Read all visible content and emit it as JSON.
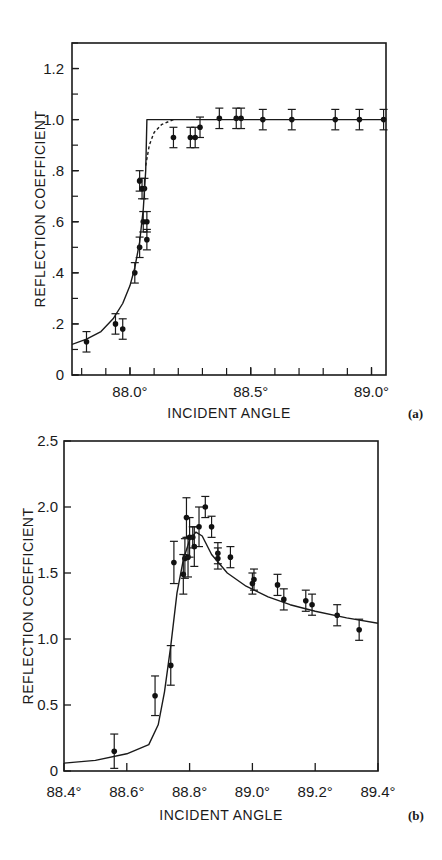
{
  "chart_data": [
    {
      "id": "a",
      "panel_label": "(a)",
      "type": "scatter",
      "title": "",
      "xlabel": "INCIDENT ANGLE",
      "ylabel": "REFLECTION COEFFICIENT",
      "xlim": [
        87.76,
        89.06
      ],
      "ylim": [
        0,
        1.3
      ],
      "x_ticks": [
        {
          "v": 88.0,
          "label": "88.0°"
        },
        {
          "v": 88.5,
          "label": "88.5°"
        },
        {
          "v": 89.0,
          "label": "89.0°"
        }
      ],
      "x_minor_step": 0.1,
      "y_ticks": [
        {
          "v": 0,
          "label": "0"
        },
        {
          "v": 0.2,
          "label": ".2"
        },
        {
          "v": 0.4,
          "label": ".4"
        },
        {
          "v": 0.6,
          "label": ".6"
        },
        {
          "v": 0.8,
          "label": ".8"
        },
        {
          "v": 1.0,
          "label": "1.0"
        },
        {
          "v": 1.2,
          "label": "1.2"
        }
      ],
      "y_minor_step": 0.1,
      "grid": false,
      "series": [
        {
          "name": "measured",
          "style": "points-with-error-bars",
          "points": [
            {
              "x": 87.82,
              "y": 0.13,
              "err": 0.04
            },
            {
              "x": 87.94,
              "y": 0.2,
              "err": 0.04
            },
            {
              "x": 87.97,
              "y": 0.18,
              "err": 0.04
            },
            {
              "x": 88.02,
              "y": 0.4,
              "err": 0.04
            },
            {
              "x": 88.04,
              "y": 0.5,
              "err": 0.04
            },
            {
              "x": 88.04,
              "y": 0.76,
              "err": 0.04
            },
            {
              "x": 88.05,
              "y": 0.73,
              "err": 0.04
            },
            {
              "x": 88.055,
              "y": 0.6,
              "err": 0.04
            },
            {
              "x": 88.06,
              "y": 0.73,
              "err": 0.04
            },
            {
              "x": 88.07,
              "y": 0.6,
              "err": 0.04
            },
            {
              "x": 88.07,
              "y": 0.53,
              "err": 0.04
            },
            {
              "x": 88.18,
              "y": 0.93,
              "err": 0.04
            },
            {
              "x": 88.25,
              "y": 0.93,
              "err": 0.04
            },
            {
              "x": 88.27,
              "y": 0.93,
              "err": 0.04
            },
            {
              "x": 88.29,
              "y": 0.97,
              "err": 0.04
            },
            {
              "x": 88.37,
              "y": 1.005,
              "err": 0.04
            },
            {
              "x": 88.44,
              "y": 1.005,
              "err": 0.04
            },
            {
              "x": 88.46,
              "y": 1.005,
              "err": 0.04
            },
            {
              "x": 88.55,
              "y": 1.0,
              "err": 0.04
            },
            {
              "x": 88.67,
              "y": 1.0,
              "err": 0.04
            },
            {
              "x": 88.85,
              "y": 1.0,
              "err": 0.04
            },
            {
              "x": 88.95,
              "y": 1.0,
              "err": 0.04
            },
            {
              "x": 89.05,
              "y": 1.0,
              "err": 0.04
            }
          ]
        },
        {
          "name": "theory-solid",
          "style": "solid-line",
          "points": [
            [
              87.76,
              0.12
            ],
            [
              87.82,
              0.14
            ],
            [
              87.88,
              0.17
            ],
            [
              87.93,
              0.22
            ],
            [
              87.97,
              0.28
            ],
            [
              88.0,
              0.35
            ],
            [
              88.02,
              0.42
            ],
            [
              88.04,
              0.52
            ],
            [
              88.055,
              0.65
            ],
            [
              88.065,
              0.8
            ],
            [
              88.07,
              1.0
            ],
            [
              89.06,
              1.0
            ]
          ]
        },
        {
          "name": "theory-dashed",
          "style": "dashed-line",
          "points": [
            [
              88.065,
              0.82
            ],
            [
              88.08,
              0.9
            ],
            [
              88.1,
              0.95
            ],
            [
              88.13,
              0.98
            ],
            [
              88.18,
              1.0
            ]
          ]
        }
      ]
    },
    {
      "id": "b",
      "panel_label": "(b)",
      "type": "scatter",
      "title": "",
      "xlabel": "INCIDENT ANGLE",
      "ylabel": "REFLECTION COEFFICIENT",
      "xlim": [
        88.4,
        89.4
      ],
      "ylim": [
        0,
        2.5
      ],
      "x_ticks": [
        {
          "v": 88.4,
          "label": "88.4°"
        },
        {
          "v": 88.6,
          "label": "88.6°"
        },
        {
          "v": 88.8,
          "label": "88.8°"
        },
        {
          "v": 89.0,
          "label": "89.0°"
        },
        {
          "v": 89.2,
          "label": "89.2°"
        },
        {
          "v": 89.4,
          "label": "89.4°"
        }
      ],
      "y_ticks": [
        {
          "v": 0,
          "label": "0"
        },
        {
          "v": 0.5,
          "label": "0.5"
        },
        {
          "v": 1.0,
          "label": "1.0"
        },
        {
          "v": 1.5,
          "label": "1.5"
        },
        {
          "v": 2.0,
          "label": "2.0"
        },
        {
          "v": 2.5,
          "label": "2.5"
        }
      ],
      "grid": false,
      "series": [
        {
          "name": "measured",
          "style": "points-with-error-bars",
          "points": [
            {
              "x": 88.56,
              "y": 0.15,
              "err": 0.13
            },
            {
              "x": 88.69,
              "y": 0.57,
              "err": 0.15
            },
            {
              "x": 88.74,
              "y": 0.8,
              "err": 0.15
            },
            {
              "x": 88.75,
              "y": 1.58,
              "err": 0.16
            },
            {
              "x": 88.78,
              "y": 1.49,
              "err": 0.15
            },
            {
              "x": 88.785,
              "y": 1.61,
              "err": 0.15
            },
            {
              "x": 88.79,
              "y": 1.92,
              "err": 0.15
            },
            {
              "x": 88.795,
              "y": 1.62,
              "err": 0.15
            },
            {
              "x": 88.8,
              "y": 1.77,
              "err": 0.15
            },
            {
              "x": 88.81,
              "y": 1.77,
              "err": 0.08
            },
            {
              "x": 88.815,
              "y": 1.7,
              "err": 0.15
            },
            {
              "x": 88.83,
              "y": 1.85,
              "err": 0.15
            },
            {
              "x": 88.85,
              "y": 2.0,
              "err": 0.08
            },
            {
              "x": 88.87,
              "y": 1.85,
              "err": 0.08
            },
            {
              "x": 88.89,
              "y": 1.65,
              "err": 0.08
            },
            {
              "x": 88.89,
              "y": 1.61,
              "err": 0.08
            },
            {
              "x": 88.93,
              "y": 1.62,
              "err": 0.08
            },
            {
              "x": 89.0,
              "y": 1.42,
              "err": 0.08
            },
            {
              "x": 89.005,
              "y": 1.45,
              "err": 0.08
            },
            {
              "x": 89.08,
              "y": 1.41,
              "err": 0.08
            },
            {
              "x": 89.1,
              "y": 1.3,
              "err": 0.08
            },
            {
              "x": 89.17,
              "y": 1.29,
              "err": 0.08
            },
            {
              "x": 89.19,
              "y": 1.26,
              "err": 0.08
            },
            {
              "x": 89.27,
              "y": 1.18,
              "err": 0.08
            },
            {
              "x": 89.34,
              "y": 1.07,
              "err": 0.08
            }
          ]
        },
        {
          "name": "theory",
          "style": "solid-line",
          "points": [
            [
              88.4,
              0.06
            ],
            [
              88.5,
              0.08
            ],
            [
              88.6,
              0.13
            ],
            [
              88.67,
              0.2
            ],
            [
              88.7,
              0.35
            ],
            [
              88.72,
              0.6
            ],
            [
              88.74,
              0.95
            ],
            [
              88.76,
              1.35
            ],
            [
              88.78,
              1.6
            ],
            [
              88.8,
              1.75
            ],
            [
              88.82,
              1.81
            ],
            [
              88.84,
              1.78
            ],
            [
              88.87,
              1.64
            ],
            [
              88.92,
              1.5
            ],
            [
              88.98,
              1.4
            ],
            [
              89.05,
              1.32
            ],
            [
              89.12,
              1.26
            ],
            [
              89.2,
              1.21
            ],
            [
              89.3,
              1.16
            ],
            [
              89.4,
              1.12
            ]
          ]
        }
      ]
    }
  ]
}
